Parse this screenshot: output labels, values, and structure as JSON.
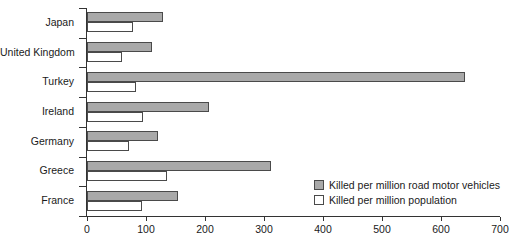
{
  "chart_data": {
    "type": "bar",
    "orientation": "horizontal",
    "title": "",
    "xlabel": "",
    "ylabel": "",
    "xlim": [
      0,
      700
    ],
    "xticks": [
      0,
      100,
      200,
      300,
      400,
      500,
      600,
      700
    ],
    "grid": false,
    "legend_position": "inside-bottom-right",
    "categories": [
      "Japan",
      "United Kingdom",
      "Turkey",
      "Ireland",
      "Germany",
      "Greece",
      "France"
    ],
    "series": [
      {
        "name": "Killed per million road motor vehicles",
        "color": "#a9a9a9",
        "values": [
          128,
          110,
          640,
          207,
          120,
          312,
          155
        ]
      },
      {
        "name": "Killed per million population",
        "color": "#ffffff",
        "values": [
          78,
          60,
          83,
          95,
          72,
          136,
          93
        ]
      }
    ]
  },
  "legend": {
    "items": [
      {
        "label": "Killed per million road motor vehicles",
        "swatch": "vehicles"
      },
      {
        "label": "Killed per million population",
        "swatch": "population"
      }
    ]
  }
}
